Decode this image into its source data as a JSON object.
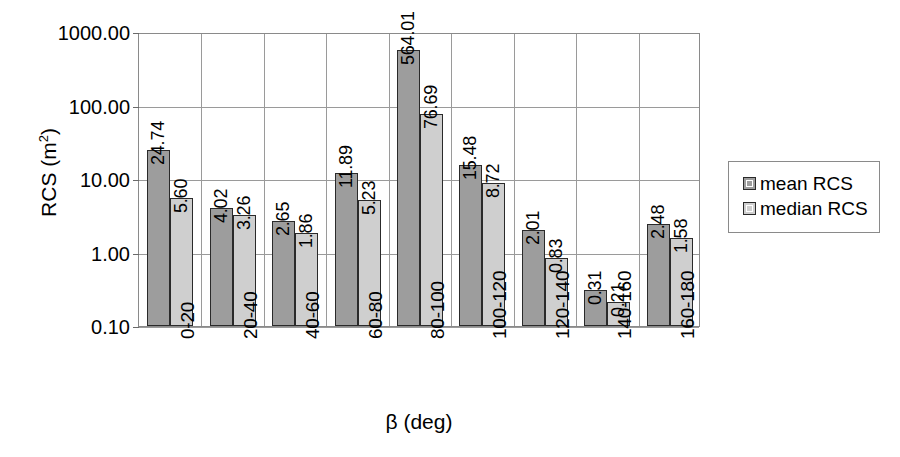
{
  "chart_data": {
    "type": "bar",
    "title": "",
    "xlabel": "β (deg)",
    "ylabel": "RCS (m²)",
    "ylabel_base": "RCS (m",
    "ylabel_sup": "2",
    "ylabel_close": ")",
    "yscale": "log",
    "ylim": [
      0.1,
      1000
    ],
    "ytick_labels": [
      "1000.00",
      "100.00",
      "10.00",
      "1.00",
      "0.10"
    ],
    "ytick_values": [
      1000,
      100,
      10,
      1,
      0.1
    ],
    "grid": true,
    "legend_position": "right",
    "categories": [
      "0-20",
      "20-40",
      "40-60",
      "60-80",
      "80-100",
      "100-120",
      "120-140",
      "140-160",
      "160-180"
    ],
    "series": [
      {
        "name": "mean RCS",
        "color": "#9d9d9d",
        "values": [
          24.74,
          4.02,
          2.65,
          11.89,
          564.01,
          15.48,
          2.01,
          0.31,
          2.48
        ],
        "labels": [
          "24.74",
          "4.02",
          "2.65",
          "11.89",
          "564.01",
          "15.48",
          "2.01",
          "0.31",
          "2.48"
        ]
      },
      {
        "name": "median RCS",
        "color": "#cfcfcf",
        "values": [
          5.6,
          3.26,
          1.86,
          5.23,
          76.69,
          8.72,
          0.83,
          0.21,
          1.58
        ],
        "labels": [
          "5.60",
          "3.26",
          "1.86",
          "5.23",
          "76.69",
          "8.72",
          "0.83",
          "0.21",
          "1.58"
        ]
      }
    ]
  },
  "legend": {
    "items": [
      {
        "label": "mean RCS",
        "swatch": "mean"
      },
      {
        "label": "median RCS",
        "swatch": "median"
      }
    ]
  }
}
